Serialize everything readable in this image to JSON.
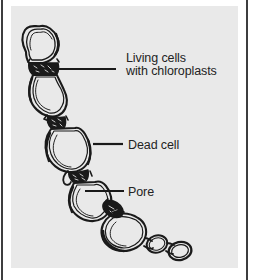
{
  "figure": {
    "kind": "biology-diagram",
    "background_color": "#e9e9e9",
    "ink_color": "#1a1a1a",
    "page_rule_color": "#3d3d3f"
  },
  "labels": {
    "living_cells": {
      "line1": "Living cells",
      "line2": "with chloroplasts"
    },
    "dead_cell": "Dead cell",
    "pore": "Pore"
  },
  "structures": {
    "cell_1": "living-cell-top",
    "cell_2": "living-cell-upper-middle",
    "cell_3": "dead-cell-middle",
    "cell_4": "living-cell-lower",
    "cell_5": "living-cell-bottom",
    "chloroplast_band_1": "chloroplast-band-upper",
    "chloroplast_band_2": "chloroplast-band-middle",
    "chloroplast_band_3": "chloroplast-band-lower",
    "chloroplast_band_4": "chloroplast-band-pore",
    "terminal_vesicle_1": "terminal-vesicle-small",
    "terminal_vesicle_2": "terminal-vesicle-end"
  }
}
